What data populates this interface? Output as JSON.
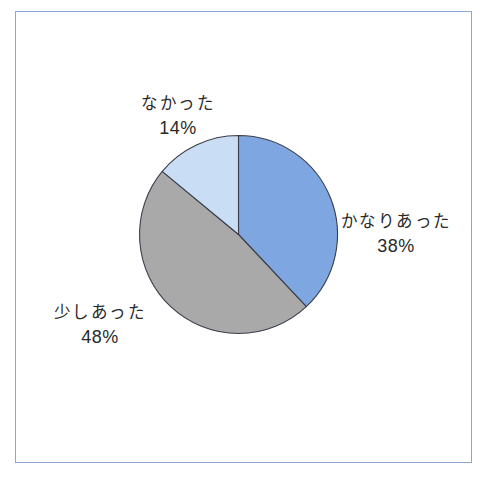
{
  "chart_data": {
    "type": "pie",
    "title": "",
    "start_angle_deg": 0,
    "direction": "clockwise",
    "categories": [
      "かなりあった",
      "少しあった",
      "なかった"
    ],
    "values": [
      38,
      48,
      14
    ],
    "unit": "%",
    "colors": [
      "#7ea6e0",
      "#a9a9a9",
      "#c9def4"
    ],
    "slice_border_color": "#3a3f4a",
    "legend": "none",
    "labels_position": "outside",
    "labels": [
      {
        "name": "かなりあった",
        "pct": "38%"
      },
      {
        "name": "少しあった",
        "pct": "48%"
      },
      {
        "name": "なかった",
        "pct": "14%"
      }
    ]
  },
  "frame": {
    "border_color": "#8aa6d6"
  }
}
